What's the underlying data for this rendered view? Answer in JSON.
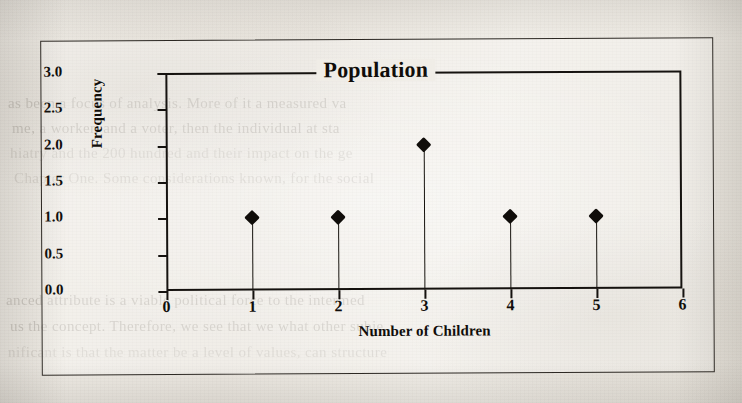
{
  "page": {
    "background_color": "#efece6",
    "ink_color": "#100d0a",
    "ghost_text": [
      "as been a focus of analysis. More of it a measured va",
      "me, a worker, and a voter, then the individual at sta",
      "hiatry and the 200 hundred and their impact on the ge",
      "Chapter One. Some considerations known, for the social",
      "anced attribute is a viable political force to the intermed",
      "us the concept. Therefore, we see that we what other subje",
      "nificant is that the matter be a level of values, can structure"
    ]
  },
  "chart_data": {
    "type": "scatter",
    "title": "Population",
    "xlabel": "Number of Children",
    "ylabel": "Frequency",
    "x": [
      1,
      2,
      3,
      4,
      5
    ],
    "values": [
      1.0,
      1.0,
      2.0,
      1.0,
      1.0
    ],
    "categories": [
      "1",
      "2",
      "3",
      "4",
      "5"
    ],
    "xlim": [
      0,
      6
    ],
    "ylim": [
      0.0,
      3.0
    ],
    "x_ticks": [
      "0",
      "1",
      "2",
      "3",
      "4",
      "5",
      "6"
    ],
    "x_tick_values": [
      0,
      1,
      2,
      3,
      4,
      5,
      6
    ],
    "y_ticks": [
      "0.0",
      "0.5",
      "1.0",
      "1.5",
      "2.0",
      "2.5",
      "3.0"
    ],
    "y_tick_values": [
      0.0,
      0.5,
      1.0,
      1.5,
      2.0,
      2.5,
      3.0
    ],
    "grid": false,
    "legend": false,
    "marker": "filled-diamond",
    "marker_color": "#100d0a",
    "stems": true,
    "points": [
      {
        "x": 1,
        "y": 1.0
      },
      {
        "x": 2,
        "y": 1.0
      },
      {
        "x": 3,
        "y": 2.0
      },
      {
        "x": 4,
        "y": 1.0
      },
      {
        "x": 5,
        "y": 1.0
      }
    ]
  }
}
